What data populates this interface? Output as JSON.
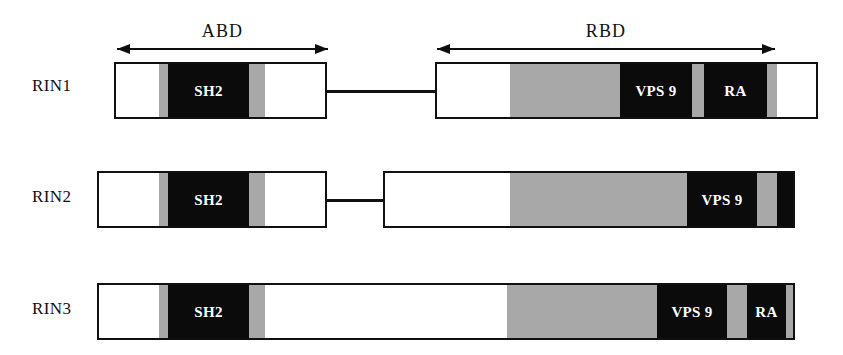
{
  "figure": {
    "colors": {
      "outline": "#111111",
      "black_domain": "#0b0b0b",
      "gray_domain": "#a8a8a8",
      "white_domain": "#ffffff",
      "label_text": "#111111",
      "domain_text": "#ffffff"
    }
  },
  "span_arrows": [
    {
      "label": "ABD",
      "x": 117,
      "y": 44,
      "width": 211
    },
    {
      "label": "RBD",
      "x": 437,
      "y": 44,
      "width": 338
    }
  ],
  "rows": [
    {
      "name": "RIN1",
      "label": "RIN1",
      "label_x": 32,
      "label_y": 87,
      "bars": [
        {
          "name": "rin1-abd-bar",
          "x": 114,
          "y": 62,
          "width": 213,
          "height": 57,
          "segments": [
            {
              "kind": "white",
              "label": "",
              "x": 0,
              "width": 43
            },
            {
              "kind": "gray",
              "label": "",
              "x": 43,
              "width": 9
            },
            {
              "kind": "black",
              "label": "SH2",
              "x": 52,
              "width": 81
            },
            {
              "kind": "gray",
              "label": "",
              "x": 133,
              "width": 16
            },
            {
              "kind": "white",
              "label": "",
              "x": 149,
              "width": 64
            }
          ]
        },
        {
          "name": "rin1-rbd-bar",
          "x": 435,
          "y": 62,
          "width": 383,
          "height": 57,
          "segments": [
            {
              "kind": "white",
              "label": "",
              "x": 0,
              "width": 73
            },
            {
              "kind": "gray",
              "label": "",
              "x": 73,
              "width": 110
            },
            {
              "kind": "black",
              "label": "VPS 9",
              "x": 183,
              "width": 72
            },
            {
              "kind": "gray",
              "label": "",
              "x": 255,
              "width": 12
            },
            {
              "kind": "black",
              "label": "RA",
              "x": 267,
              "width": 63
            },
            {
              "kind": "gray",
              "label": "",
              "x": 330,
              "width": 10
            },
            {
              "kind": "white",
              "label": "",
              "x": 340,
              "width": 43
            }
          ]
        }
      ],
      "linker": {
        "x": 327,
        "y": 90,
        "width": 108
      }
    },
    {
      "name": "RIN2",
      "label": "RIN2",
      "label_x": 32,
      "label_y": 198,
      "bars": [
        {
          "name": "rin2-abd-bar",
          "x": 97,
          "y": 171,
          "width": 230,
          "height": 57,
          "segments": [
            {
              "kind": "white",
              "label": "",
              "x": 0,
              "width": 60
            },
            {
              "kind": "gray",
              "label": "",
              "x": 60,
              "width": 9
            },
            {
              "kind": "black",
              "label": "SH2",
              "x": 69,
              "width": 81
            },
            {
              "kind": "gray",
              "label": "",
              "x": 150,
              "width": 16
            },
            {
              "kind": "white",
              "label": "",
              "x": 166,
              "width": 64
            }
          ]
        },
        {
          "name": "rin2-rbd-bar",
          "x": 383,
          "y": 171,
          "width": 412,
          "height": 57,
          "segments": [
            {
              "kind": "white",
              "label": "",
              "x": 0,
              "width": 125
            },
            {
              "kind": "gray",
              "label": "",
              "x": 125,
              "width": 177
            },
            {
              "kind": "black",
              "label": "VPS 9",
              "x": 302,
              "width": 0
            },
            {
              "kind": "gray",
              "label": "",
              "x": 302,
              "width": 0
            },
            {
              "kind": "black",
              "label": "RA",
              "x": 302,
              "width": 0
            },
            {
              "kind": "gray",
              "label": "",
              "x": 302,
              "width": 0
            },
            {
              "kind": "white",
              "label": "",
              "x": 302,
              "width": 0
            }
          ]
        }
      ],
      "linker": {
        "x": 327,
        "y": 199,
        "width": 58
      }
    },
    {
      "name": "RIN3",
      "label": "RIN3",
      "label_x": 32,
      "label_y": 310,
      "bars": [
        {
          "name": "rin3-full-bar",
          "x": 97,
          "y": 283,
          "width": 698,
          "height": 57,
          "segments": [
            {
              "kind": "white",
              "label": "",
              "x": 0,
              "width": 60
            },
            {
              "kind": "gray",
              "label": "",
              "x": 60,
              "width": 9
            },
            {
              "kind": "black",
              "label": "SH2",
              "x": 69,
              "width": 81
            },
            {
              "kind": "gray",
              "label": "",
              "x": 150,
              "width": 16
            },
            {
              "kind": "white",
              "label": "",
              "x": 166,
              "width": 242
            },
            {
              "kind": "gray",
              "label": "",
              "x": 408,
              "width": 150
            },
            {
              "kind": "black",
              "label": "VPS 9",
              "x": 558,
              "width": 70
            },
            {
              "kind": "gray",
              "label": "",
              "x": 628,
              "width": 20
            },
            {
              "kind": "black",
              "label": "RA",
              "x": 648,
              "width": 39
            },
            {
              "kind": "gray",
              "label": "",
              "x": 687,
              "width": 10
            },
            {
              "kind": "white",
              "label": "",
              "x": 697,
              "width": 1
            }
          ]
        }
      ],
      "linker": null
    }
  ],
  "rin2_rbd_segments": [
    {
      "kind": "white",
      "label": "",
      "x": 0,
      "width": 125
    },
    {
      "kind": "gray",
      "label": "",
      "x": 125,
      "width": 177
    },
    {
      "kind": "black",
      "label": "VPS 9",
      "x": 302,
      "width": 70
    },
    {
      "kind": "gray",
      "label": "",
      "x": 372,
      "width": 20
    },
    {
      "kind": "black",
      "label": "RA",
      "x": 392,
      "width": 62
    },
    {
      "kind": "gray",
      "label": "",
      "x": 454,
      "width": 10
    },
    {
      "kind": "white",
      "label": "",
      "x": 464,
      "width": 18
    }
  ],
  "domain_legend_names": [
    "SH2",
    "VPS 9",
    "RA",
    "ABD",
    "RBD"
  ]
}
